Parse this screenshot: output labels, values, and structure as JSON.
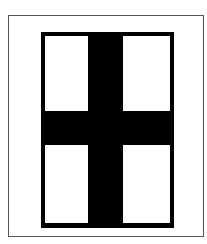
{
  "figure": {
    "colors": {
      "frame": "#000000",
      "pane": "#ffffff",
      "border": "#555555"
    },
    "panes": [
      {
        "name": "top-left"
      },
      {
        "name": "top-right"
      },
      {
        "name": "bottom-left"
      },
      {
        "name": "bottom-right"
      }
    ]
  }
}
